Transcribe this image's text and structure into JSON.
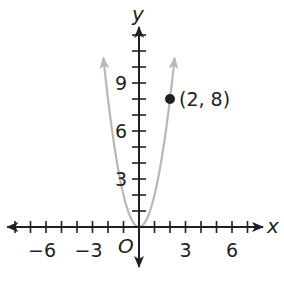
{
  "chart_data": {
    "type": "line",
    "title": "",
    "xlabel": "x",
    "ylabel": "y",
    "origin_label": "O",
    "xlim": [
      -8.5,
      8
    ],
    "ylim": [
      -2.5,
      12.5
    ],
    "x_ticks_step": 1,
    "y_ticks_step": 1,
    "x_tick_labels": [
      {
        "value": -6,
        "text": "−6"
      },
      {
        "value": -3,
        "text": "−3"
      },
      {
        "value": 3,
        "text": "3"
      },
      {
        "value": 6,
        "text": "6"
      }
    ],
    "y_tick_labels": [
      {
        "value": 3,
        "text": "3"
      },
      {
        "value": 6,
        "text": "6"
      },
      {
        "value": 9,
        "text": "9"
      }
    ],
    "grid": false,
    "series": [
      {
        "name": "y = 2x²",
        "kind": "parabola",
        "color": "#b8b8b8",
        "x": [
          -2.3,
          -2,
          -1.5,
          -1,
          -0.5,
          0,
          0.5,
          1,
          1.5,
          2,
          2.3
        ],
        "y": [
          10.58,
          8,
          4.5,
          2,
          0.5,
          0,
          0.5,
          2,
          4.5,
          8,
          10.58
        ]
      }
    ],
    "points": [
      {
        "x": 2,
        "y": 8,
        "label": "(2, 8)",
        "color": "#231f20"
      }
    ]
  },
  "colors": {
    "axis": "#231f20",
    "curve": "#b8b8b8",
    "point": "#231f20"
  }
}
